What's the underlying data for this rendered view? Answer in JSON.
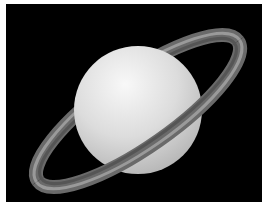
{
  "image": {
    "subject": "Saturn",
    "description": "Illustration of the planet Saturn with its rings on a black background",
    "colors": {
      "background": "#000000",
      "border": "#ffffff",
      "planet_light": "#f2f2f2",
      "planet_mid": "#d6d6d6",
      "planet_shadow": "#b8b8b8",
      "ring_outer": "#5a5a5a",
      "ring_mid": "#8c8c8c",
      "ring_inner": "#6e6e6e"
    }
  }
}
